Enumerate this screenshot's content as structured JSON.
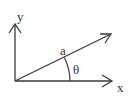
{
  "diagram": {
    "type": "vector-angle",
    "colors": {
      "stroke": "#3a3a3a",
      "text": "#333333",
      "background": "#ffffff"
    },
    "axes": {
      "x_label": "x",
      "y_label": "y"
    },
    "vector": {
      "label": "a"
    },
    "angle": {
      "label": "θ"
    }
  }
}
